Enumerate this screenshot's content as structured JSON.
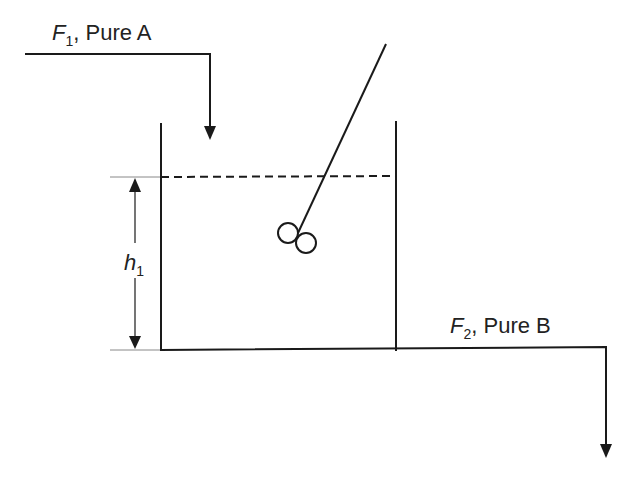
{
  "diagram": {
    "inlet": {
      "symbol": "F",
      "subscript": "1",
      "description": ", Pure A"
    },
    "outlet": {
      "symbol": "F",
      "subscript": "2",
      "description": ", Pure B"
    },
    "level": {
      "symbol": "h",
      "subscript": "1"
    },
    "colors": {
      "stroke": "#1a1a1a",
      "background": "#ffffff",
      "thin_line": "#888888"
    }
  }
}
